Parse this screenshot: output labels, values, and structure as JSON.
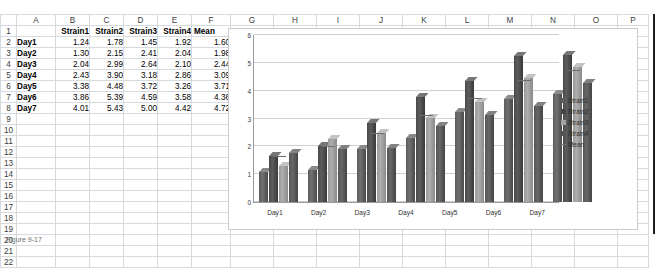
{
  "spreadsheet": {
    "column_headers": [
      "A",
      "B",
      "C",
      "D",
      "E",
      "F",
      "G",
      "H",
      "I",
      "J",
      "K",
      "L",
      "M",
      "N",
      "O",
      "P"
    ],
    "row_headers": [
      "1",
      "2",
      "3",
      "4",
      "5",
      "6",
      "7",
      "8",
      "9",
      "10",
      "11",
      "12",
      "13",
      "14",
      "15",
      "16",
      "17",
      "18",
      "19",
      "20",
      "21",
      "22"
    ],
    "header_row": {
      "a": "",
      "b": "Strain1",
      "c": "Strain2",
      "d": "Strain3",
      "e": "Strain4",
      "f": "Mean"
    },
    "rows": [
      {
        "label": "Day1",
        "strain1": "1.24",
        "strain2": "1.78",
        "strain3": "1.45",
        "strain4": "1.92",
        "mean": "1.60"
      },
      {
        "label": "Day2",
        "strain1": "1.30",
        "strain2": "2.15",
        "strain3": "2.41",
        "strain4": "2.04",
        "mean": "1.98"
      },
      {
        "label": "Day3",
        "strain1": "2.04",
        "strain2": "2.99",
        "strain3": "2.64",
        "strain4": "2.10",
        "mean": "2.44"
      },
      {
        "label": "Day4",
        "strain1": "2.43",
        "strain2": "3.90",
        "strain3": "3.18",
        "strain4": "2.86",
        "mean": "3.09"
      },
      {
        "label": "Day5",
        "strain1": "3.38",
        "strain2": "4.48",
        "strain3": "3.72",
        "strain4": "3.26",
        "mean": "3.71"
      },
      {
        "label": "Day6",
        "strain1": "3.86",
        "strain2": "5.39",
        "strain3": "4.59",
        "strain4": "3.58",
        "mean": "4.36"
      },
      {
        "label": "Day7",
        "strain1": "4.01",
        "strain2": "5.43",
        "strain3": "5.00",
        "strain4": "4.42",
        "mean": "4.72"
      }
    ]
  },
  "chart_data": {
    "type": "bar",
    "title": "",
    "xlabel": "",
    "ylabel": "",
    "ylim": [
      0,
      6
    ],
    "yticks": [
      "0",
      "1",
      "2",
      "3",
      "4",
      "5",
      "6"
    ],
    "grid": true,
    "legend_position": "right",
    "categories": [
      "Day1",
      "Day2",
      "Day3",
      "Day4",
      "Day5",
      "Day6",
      "Day7"
    ],
    "series": [
      {
        "name": "Strain1",
        "values": [
          1.24,
          1.3,
          2.04,
          2.43,
          3.38,
          3.86,
          4.01
        ],
        "color": "#5d5d5d"
      },
      {
        "name": "Strain2",
        "values": [
          1.78,
          2.15,
          2.99,
          3.9,
          4.48,
          5.39,
          5.43
        ],
        "color": "#454545"
      },
      {
        "name": "Strain3",
        "values": [
          1.45,
          2.41,
          2.64,
          3.18,
          3.72,
          4.59,
          5.0
        ],
        "color": "#a2a2a2"
      },
      {
        "name": "Strain4",
        "values": [
          1.92,
          2.04,
          2.1,
          2.86,
          3.26,
          3.58,
          4.42
        ],
        "color": "#555555"
      },
      {
        "name": "Mean",
        "values": [
          1.6,
          1.98,
          2.44,
          3.09,
          3.71,
          4.36,
          4.72
        ],
        "color": "#6e6e6e",
        "render": "line-marker"
      }
    ]
  },
  "caption": {
    "text": "Figure 9-17"
  }
}
